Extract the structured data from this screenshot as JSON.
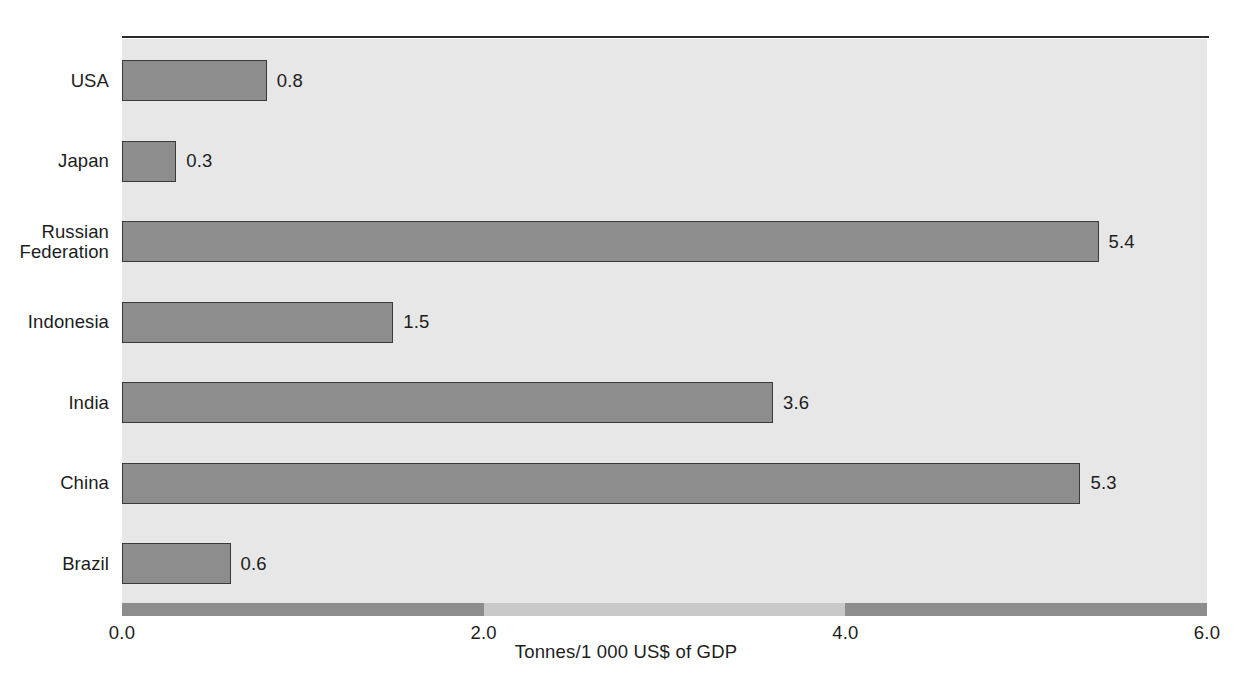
{
  "chart_data": {
    "type": "bar",
    "orientation": "horizontal",
    "title": "",
    "xlabel": "Tonnes/1 000 US$ of GDP",
    "ylabel": "",
    "xlim": [
      0.0,
      6.0
    ],
    "xticks": [
      "0.0",
      "2.0",
      "4.0",
      "6.0"
    ],
    "xtick_values": [
      0.0,
      2.0,
      4.0,
      6.0
    ],
    "grid": false,
    "legend": "none",
    "categories": [
      "USA",
      "Japan",
      "Russian\nFederation",
      "Indonesia",
      "India",
      "China",
      "Brazil"
    ],
    "values": [
      0.8,
      0.3,
      5.4,
      1.5,
      3.6,
      5.3,
      0.6
    ],
    "value_labels": [
      "0.8",
      "0.3",
      "5.4",
      "1.5",
      "3.6",
      "5.3",
      "0.6"
    ],
    "series": [
      {
        "name": "CO2 intensity",
        "values": [
          0.8,
          0.3,
          5.4,
          1.5,
          3.6,
          5.3,
          0.6
        ]
      }
    ],
    "colors": {
      "bar_fill": "#8d8d8d",
      "bar_border": "#3a3a3a",
      "plot_background": "#e7e7e7",
      "axis_strip_dark": "#8d8d8d",
      "axis_strip_light": "#c9c9c9",
      "text": "#1d1d1d"
    },
    "axis_strip_segments": [
      {
        "from": 0.0,
        "to": 2.0,
        "shade": "dark"
      },
      {
        "from": 2.0,
        "to": 4.0,
        "shade": "light"
      },
      {
        "from": 4.0,
        "to": 6.0,
        "shade": "dark"
      }
    ]
  }
}
